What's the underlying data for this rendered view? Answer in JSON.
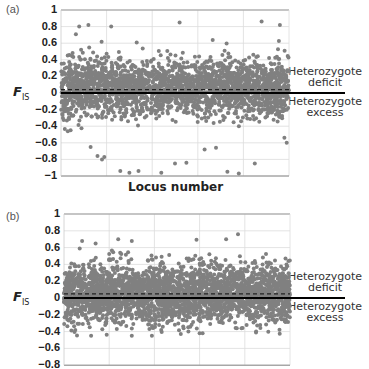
{
  "chart_data": [
    {
      "panel": "(a)",
      "type": "scatter",
      "title": "",
      "xlabel": "Locus number",
      "ylabel": "F_IS",
      "ylim": [
        -1,
        1
      ],
      "yticks": [
        "1",
        "0.8",
        "0.6",
        "0.4",
        "0.2",
        "0",
        "−0.2",
        "−0.4",
        "−0.6",
        "−0.8",
        "−1"
      ],
      "grid": true,
      "point_color": "#808080",
      "n_points_approx": 2500,
      "distribution": {
        "center": 0.06,
        "dense_band": [
          -0.3,
          0.5
        ],
        "range": [
          -1,
          0.85
        ]
      },
      "reference_lines": [
        {
          "y": 0,
          "style": "solid",
          "label_above": "Heterozygote deficit",
          "label_below": "Heterozygote excess"
        },
        {
          "y": 0.04,
          "style": "dashed",
          "meaning": "mean F_IS"
        }
      ],
      "outliers": [
        {
          "x": 0.03,
          "y": -0.46
        },
        {
          "x": 0.13,
          "y": -0.65
        },
        {
          "x": 0.16,
          "y": -0.76
        },
        {
          "x": 0.18,
          "y": -0.8
        },
        {
          "x": 0.19,
          "y": -0.77
        },
        {
          "x": 0.26,
          "y": -0.94
        },
        {
          "x": 0.3,
          "y": -0.96
        },
        {
          "x": 0.34,
          "y": -0.94
        },
        {
          "x": 0.44,
          "y": -0.96
        },
        {
          "x": 0.5,
          "y": -0.85
        },
        {
          "x": 0.55,
          "y": -0.84
        },
        {
          "x": 0.63,
          "y": -0.68
        },
        {
          "x": 0.68,
          "y": -0.66
        },
        {
          "x": 0.73,
          "y": -0.95
        },
        {
          "x": 0.78,
          "y": -0.97
        },
        {
          "x": 0.85,
          "y": -0.85
        },
        {
          "x": 0.98,
          "y": -0.54
        },
        {
          "x": 0.99,
          "y": -0.6
        },
        {
          "x": 0.08,
          "y": 0.8
        },
        {
          "x": 0.12,
          "y": 0.82
        },
        {
          "x": 0.22,
          "y": 0.8
        },
        {
          "x": 0.52,
          "y": 0.85
        },
        {
          "x": 0.88,
          "y": 0.86
        },
        {
          "x": 0.96,
          "y": 0.82
        }
      ]
    },
    {
      "panel": "(b)",
      "type": "scatter",
      "title": "",
      "xlabel": "",
      "ylabel": "F_IS",
      "ylim": [
        -0.8,
        1
      ],
      "yticks": [
        "1",
        "0.8",
        "0.6",
        "0.4",
        "0.2",
        "0",
        "−0.2",
        "−0.4",
        "−0.6",
        "−0.8"
      ],
      "grid": true,
      "point_color": "#808080",
      "n_points_approx": 3000,
      "distribution": {
        "center": 0.05,
        "dense_band": [
          -0.3,
          0.45
        ],
        "range": [
          -0.45,
          0.75
        ]
      },
      "reference_lines": [
        {
          "y": 0,
          "style": "solid",
          "label_above": "Heterozygote deficit",
          "label_below": "Heterozygote excess"
        },
        {
          "y": 0.05,
          "style": "dashed",
          "meaning": "mean F_IS"
        }
      ],
      "outliers": [
        {
          "x": 0.08,
          "y": 0.68
        },
        {
          "x": 0.14,
          "y": 0.65
        },
        {
          "x": 0.24,
          "y": 0.7
        },
        {
          "x": 0.3,
          "y": 0.68
        },
        {
          "x": 0.77,
          "y": 0.76
        },
        {
          "x": 0.12,
          "y": -0.45
        },
        {
          "x": 0.05,
          "y": -0.38
        },
        {
          "x": 0.43,
          "y": -0.38
        },
        {
          "x": 0.6,
          "y": -0.42
        },
        {
          "x": 0.85,
          "y": -0.4
        },
        {
          "x": 0.3,
          "y": -0.45
        }
      ]
    }
  ],
  "panels": [
    {
      "label": "(a)",
      "ylabel_main": "F",
      "ylabel_sub": "IS",
      "xlabel": "Locus number",
      "annotation_above": [
        "Heterozygote",
        "deficit"
      ],
      "annotation_below": [
        "Heterozygote",
        "excess"
      ]
    },
    {
      "label": "(b)",
      "ylabel_main": "F",
      "ylabel_sub": "IS",
      "xlabel": "",
      "annotation_above": [
        "Heterozygote",
        "deficit"
      ],
      "annotation_below": [
        "Heterozygote",
        "excess"
      ]
    }
  ]
}
